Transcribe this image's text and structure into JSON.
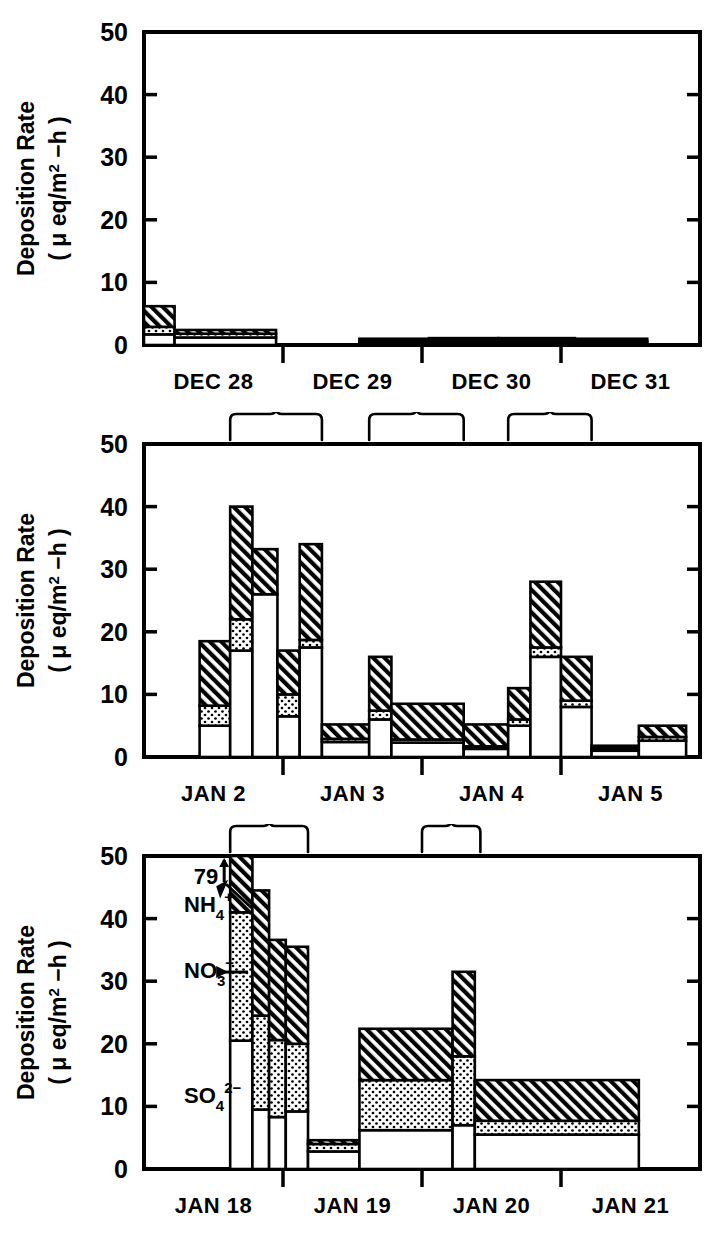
{
  "figure": {
    "axis_label_line1": "Deposition Rate",
    "axis_label_line2_prefix": "(",
    "axis_label_line2_mu": "μ",
    "axis_label_line2_mid": "eq/m",
    "axis_label_line2_sup": "2",
    "axis_label_line2_suffix": "−h )",
    "y_ticks": [
      "0",
      "10",
      "20",
      "30",
      "40",
      "50"
    ],
    "annotations": {
      "overflow_value": "79",
      "overflow_arrow": "↑",
      "nh4_label": "NH",
      "nh4_sub": "4",
      "nh4_sup": "+",
      "no3_label": "NO",
      "no3_sub": "3",
      "no3_sup": "−",
      "no3_arrow": "→",
      "so4_label": "SO",
      "so4_sub": "4",
      "so4_sup": "2−"
    },
    "legend_semantics": {
      "white": "SO4 2-",
      "dotted": "NO3 -",
      "hatched": "NH4 +"
    }
  },
  "chart_data": [
    {
      "id": "panel-dec",
      "type": "bar",
      "stacked": true,
      "title": "",
      "xlabel": "",
      "ylabel": "Deposition Rate (μ eq/m2 - h)",
      "ylim": [
        0,
        50
      ],
      "yticks": [
        0,
        10,
        20,
        30,
        40,
        50
      ],
      "grid": false,
      "x_tick_labels": [
        "DEC 28",
        "DEC 29",
        "DEC 30",
        "DEC 31"
      ],
      "x_tick_label_centers": [
        0.5,
        1.5,
        2.5,
        3.5
      ],
      "x_domain_days": 4,
      "series": [
        {
          "name": "SO4 2-",
          "fill": "white"
        },
        {
          "name": "NO3 -",
          "fill": "dotted"
        },
        {
          "name": "NH4 +",
          "fill": "hatched"
        }
      ],
      "bars": [
        {
          "x0": 0.0,
          "x1": 0.22,
          "so4": 1.7,
          "no3": 1.2,
          "nh4": 3.3
        },
        {
          "x0": 0.22,
          "x1": 0.95,
          "so4": 1.2,
          "no3": 0.6,
          "nh4": 0.6
        },
        {
          "x0": 1.55,
          "x1": 2.05,
          "so4": 0.4,
          "no3": 0.3,
          "nh4": 0.3
        },
        {
          "x0": 2.05,
          "x1": 2.55,
          "so4": 0.4,
          "no3": 0.3,
          "nh4": 0.4
        },
        {
          "x0": 2.55,
          "x1": 3.1,
          "so4": 0.4,
          "no3": 0.3,
          "nh4": 0.4
        },
        {
          "x0": 3.1,
          "x1": 3.62,
          "so4": 0.4,
          "no3": 0.3,
          "nh4": 0.3
        }
      ],
      "brackets": []
    },
    {
      "id": "panel-jan-2-5",
      "type": "bar",
      "stacked": true,
      "title": "",
      "xlabel": "",
      "ylabel": "Deposition Rate (μ eq/m2 - h)",
      "ylim": [
        0,
        50
      ],
      "yticks": [
        0,
        10,
        20,
        30,
        40,
        50
      ],
      "grid": false,
      "x_tick_labels": [
        "JAN 2",
        "JAN 3",
        "JAN 4",
        "JAN 5"
      ],
      "x_tick_label_centers": [
        0.5,
        1.5,
        2.5,
        3.5
      ],
      "x_domain_days": 4,
      "series": [
        {
          "name": "SO4 2-",
          "fill": "white"
        },
        {
          "name": "NO3 -",
          "fill": "dotted"
        },
        {
          "name": "NH4 +",
          "fill": "hatched"
        }
      ],
      "bars": [
        {
          "x0": 0.4,
          "x1": 0.62,
          "so4": 5.0,
          "no3": 3.2,
          "nh4": 10.3
        },
        {
          "x0": 0.62,
          "x1": 0.78,
          "so4": 17.0,
          "no3": 5.0,
          "nh4": 18.0
        },
        {
          "x0": 0.78,
          "x1": 0.96,
          "so4": 26.0,
          "no3": 0.0,
          "nh4": 7.2
        },
        {
          "x0": 0.96,
          "x1": 1.12,
          "so4": 6.5,
          "no3": 3.5,
          "nh4": 7.0
        },
        {
          "x0": 1.12,
          "x1": 1.28,
          "so4": 17.5,
          "no3": 1.2,
          "nh4": 15.3
        },
        {
          "x0": 1.28,
          "x1": 1.62,
          "so4": 2.4,
          "no3": 0.5,
          "nh4": 2.3
        },
        {
          "x0": 1.62,
          "x1": 1.78,
          "so4": 6.0,
          "no3": 1.4,
          "nh4": 8.6
        },
        {
          "x0": 1.78,
          "x1": 2.3,
          "so4": 2.3,
          "no3": 0.5,
          "nh4": 5.7
        },
        {
          "x0": 2.3,
          "x1": 2.62,
          "so4": 1.3,
          "no3": 0.4,
          "nh4": 3.5
        },
        {
          "x0": 2.62,
          "x1": 2.78,
          "so4": 5.0,
          "no3": 1.0,
          "nh4": 5.0
        },
        {
          "x0": 2.78,
          "x1": 3.0,
          "so4": 16.0,
          "no3": 1.5,
          "nh4": 10.5
        },
        {
          "x0": 3.0,
          "x1": 3.22,
          "so4": 8.0,
          "no3": 1.0,
          "nh4": 7.0
        },
        {
          "x0": 3.22,
          "x1": 3.56,
          "so4": 1.0,
          "no3": 0.4,
          "nh4": 0.4
        },
        {
          "x0": 3.56,
          "x1": 3.9,
          "so4": 2.6,
          "no3": 0.6,
          "nh4": 1.8
        }
      ],
      "brackets": [
        {
          "x0": 0.62,
          "x1": 1.28
        },
        {
          "x0": 1.62,
          "x1": 2.3
        },
        {
          "x0": 2.62,
          "x1": 3.22
        }
      ]
    },
    {
      "id": "panel-jan-18-21",
      "type": "bar",
      "stacked": true,
      "title": "",
      "xlabel": "",
      "ylabel": "Deposition Rate (μ eq/m2 - h)",
      "ylim": [
        0,
        50
      ],
      "yticks": [
        0,
        10,
        20,
        30,
        40,
        50
      ],
      "grid": false,
      "x_tick_labels": [
        "JAN 18",
        "JAN 19",
        "JAN 20",
        "JAN 21"
      ],
      "x_tick_label_centers": [
        0.5,
        1.5,
        2.5,
        3.5
      ],
      "x_domain_days": 4,
      "overflow_bar_value": 79,
      "series": [
        {
          "name": "SO4 2-",
          "fill": "white"
        },
        {
          "name": "NO3 -",
          "fill": "dotted"
        },
        {
          "name": "NH4 +",
          "fill": "hatched"
        }
      ],
      "bars": [
        {
          "x0": 0.62,
          "x1": 0.78,
          "so4": 20.5,
          "no3": 20.5,
          "nh4": 9.0,
          "overflow": true
        },
        {
          "x0": 0.78,
          "x1": 0.9,
          "so4": 9.5,
          "no3": 15.0,
          "nh4": 20.0
        },
        {
          "x0": 0.9,
          "x1": 1.02,
          "so4": 8.3,
          "no3": 12.3,
          "nh4": 16.0
        },
        {
          "x0": 1.02,
          "x1": 1.18,
          "so4": 9.2,
          "no3": 10.8,
          "nh4": 15.5
        },
        {
          "x0": 1.18,
          "x1": 1.55,
          "so4": 2.8,
          "no3": 1.2,
          "nh4": 0.6
        },
        {
          "x0": 1.55,
          "x1": 2.22,
          "so4": 6.2,
          "no3": 8.0,
          "nh4": 8.2
        },
        {
          "x0": 2.22,
          "x1": 2.38,
          "so4": 7.0,
          "no3": 11.0,
          "nh4": 13.5
        },
        {
          "x0": 2.38,
          "x1": 3.56,
          "so4": 5.5,
          "no3": 2.2,
          "nh4": 6.5
        }
      ],
      "brackets": [
        {
          "x0": 0.62,
          "x1": 1.18
        },
        {
          "x0": 2.0,
          "x1": 2.42
        }
      ]
    }
  ]
}
